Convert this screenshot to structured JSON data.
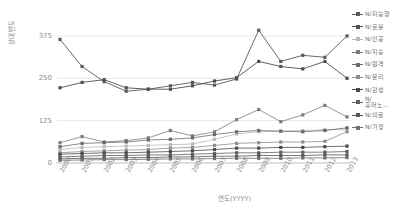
{
  "chart": {
    "type": "line",
    "title": "",
    "xlabel": "연도(YYYY)",
    "ylabel": "상대빈도",
    "grid": true,
    "legend_position": "right",
    "ylim": [
      0,
      375
    ],
    "yticks": [
      "0",
      "125",
      "250",
      "375"
    ],
    "ytick_values": [
      0,
      125,
      250,
      375
    ],
    "categories": [
      "2000",
      "2001",
      "2002",
      "2003",
      "2004",
      "2005",
      "2006",
      "2007",
      "2008",
      "2009",
      "2010",
      "2011",
      "2012",
      "2013"
    ],
    "series": [
      {
        "name": "N/지능형",
        "color": "#5a5a5a",
        "values": [
          365,
          285,
          240,
          212,
          218,
          228,
          238,
          230,
          248,
          392,
          300,
          318,
          312,
          375
        ]
      },
      {
        "name": "N/로봇",
        "color": "#4f4f4f",
        "values": [
          222,
          238,
          246,
          222,
          218,
          218,
          228,
          242,
          252,
          300,
          285,
          278,
          300,
          250
        ]
      },
      {
        "name": "N/인공",
        "color": "#b9b9b9",
        "values": [
          40,
          46,
          48,
          50,
          52,
          54,
          56,
          70,
          86,
          92,
          94,
          96,
          98,
          100
        ]
      },
      {
        "name": "N/지능",
        "color": "#7c7c7c",
        "values": [
          60,
          78,
          62,
          66,
          74,
          96,
          80,
          92,
          128,
          158,
          122,
          142,
          170,
          136
        ]
      },
      {
        "name": "N/원격",
        "color": "#6b6b6b",
        "values": [
          48,
          58,
          60,
          62,
          68,
          70,
          74,
          84,
          92,
          96,
          94,
          92,
          96,
          104
        ]
      },
      {
        "name": "N/문리",
        "color": "#8f8f8f",
        "values": [
          30,
          34,
          36,
          38,
          40,
          44,
          46,
          52,
          58,
          60,
          62,
          62,
          64,
          92
        ]
      },
      {
        "name": "N/감성",
        "color": "#4a4a4a",
        "values": [
          26,
          28,
          30,
          30,
          32,
          34,
          36,
          40,
          44,
          44,
          46,
          46,
          48,
          50
        ]
      },
      {
        "name": "N/\n휴머노...",
        "color": "#5f5f5f",
        "values": [
          18,
          20,
          22,
          22,
          24,
          24,
          26,
          28,
          30,
          30,
          32,
          32,
          32,
          34
        ]
      },
      {
        "name": "N/의료",
        "color": "#565656",
        "values": [
          12,
          14,
          14,
          16,
          16,
          18,
          18,
          20,
          20,
          22,
          22,
          22,
          24,
          24
        ]
      },
      {
        "name": "N/가정",
        "color": "#707070",
        "values": [
          8,
          9,
          10,
          10,
          11,
          12,
          12,
          13,
          14,
          14,
          14,
          15,
          15,
          16
        ]
      }
    ]
  }
}
